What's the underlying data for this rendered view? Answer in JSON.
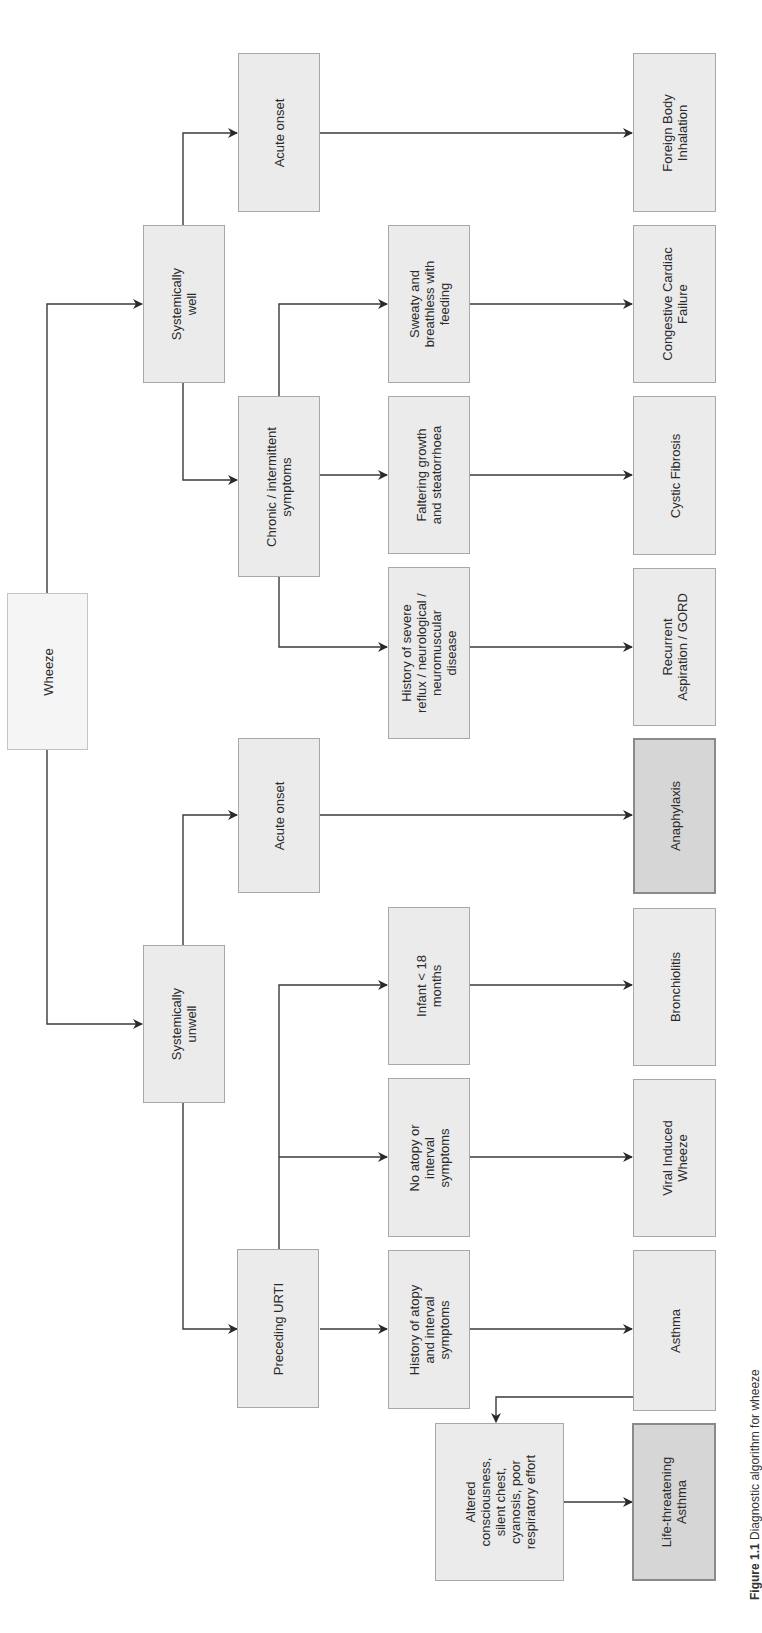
{
  "diagram": {
    "title": "Diagnostic algorithm for wheeze",
    "colors": {
      "box_fill": "#ebebeb",
      "box_border": "#a8a8a8",
      "root_fill": "#f5f5f5",
      "critical_fill": "#d6d6d6",
      "critical_border": "#8a8a8a",
      "line": "#333333"
    },
    "nodes": {
      "wheeze": "Wheeze",
      "systemically_well": "Systemically\nwell",
      "systemically_unwell": "Systemically\nunwell",
      "acute_onset_well": "Acute onset",
      "chronic_intermittent": "Chronic / intermittent\nsymptoms",
      "acute_onset_unwell": "Acute onset",
      "preceding_urti": "Preceding URTI",
      "sweaty_breathless": "Sweaty and\nbreathless with\nfeeding",
      "faltering_growth": "Faltering growth\nand steatorrhoea",
      "history_reflux": "History of severe\nreflux / neurological /\nneuromuscular\ndisease",
      "infant_under_18m": "Infant < 18\nmonths",
      "no_atopy": "No atopy or\ninterval\nsymptoms",
      "history_atopy": "History of atopy\nand interval\nsymptoms",
      "altered_consciousness": "Altered\nconsciousness,\nsilent chest,\ncyanosis, poor\nrespiratory effort",
      "foreign_body": "Foreign Body\nInhalation",
      "congestive_cardiac_failure": "Congestive Cardiac\nFailure",
      "cystic_fibrosis": "Cystic Fibrosis",
      "recurrent_aspiration": "Recurrent\nAspiration / GORD",
      "anaphylaxis": "Anaphylaxis",
      "bronchiolitis": "Bronchiolitis",
      "viral_induced_wheeze": "Viral Induced\nWheeze",
      "asthma": "Asthma",
      "life_threatening_asthma": "Life-threatening\nAsthma"
    },
    "edges": [
      [
        "wheeze",
        "systemically_well"
      ],
      [
        "wheeze",
        "systemically_unwell"
      ],
      [
        "systemically_well",
        "acute_onset_well"
      ],
      [
        "systemically_well",
        "chronic_intermittent"
      ],
      [
        "acute_onset_well",
        "foreign_body"
      ],
      [
        "chronic_intermittent",
        "sweaty_breathless"
      ],
      [
        "chronic_intermittent",
        "faltering_growth"
      ],
      [
        "chronic_intermittent",
        "history_reflux"
      ],
      [
        "sweaty_breathless",
        "congestive_cardiac_failure"
      ],
      [
        "faltering_growth",
        "cystic_fibrosis"
      ],
      [
        "history_reflux",
        "recurrent_aspiration"
      ],
      [
        "systemically_unwell",
        "acute_onset_unwell"
      ],
      [
        "systemically_unwell",
        "preceding_urti"
      ],
      [
        "acute_onset_unwell",
        "anaphylaxis"
      ],
      [
        "preceding_urti",
        "infant_under_18m"
      ],
      [
        "preceding_urti",
        "no_atopy"
      ],
      [
        "preceding_urti",
        "history_atopy"
      ],
      [
        "infant_under_18m",
        "bronchiolitis"
      ],
      [
        "no_atopy",
        "viral_induced_wheeze"
      ],
      [
        "history_atopy",
        "asthma"
      ],
      [
        "asthma",
        "altered_consciousness"
      ],
      [
        "altered_consciousness",
        "life_threatening_asthma"
      ]
    ],
    "caption": {
      "prefix": "Figure 1.1",
      "text": " Diagnostic algorithm for wheeze"
    }
  }
}
